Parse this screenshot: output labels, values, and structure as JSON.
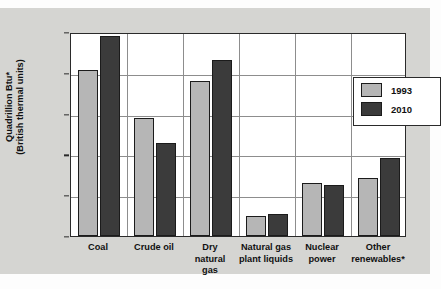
{
  "chart_data": {
    "type": "bar",
    "title": "",
    "xlabel": "",
    "ylabel_line1": "Quadrillion Btu*",
    "ylabel_line2": "(British thermal units)",
    "ylim": [
      0,
      25
    ],
    "yticks": [
      "0",
      "5",
      "10",
      "15",
      "20",
      "25"
    ],
    "grid": true,
    "legend_position": "inside-upper-right",
    "categories": [
      "Coal",
      "Crude oil",
      "Dry\nnatural\ngas",
      "Natural gas\nplant liquids",
      "Nuclear\npower",
      "Other\nrenewables*"
    ],
    "series": [
      {
        "name": "1993",
        "color": "#b6b6b6",
        "values": [
          20.3,
          14.5,
          19.0,
          2.4,
          6.5,
          7.1
        ]
      },
      {
        "name": "2010",
        "color": "#3b3b3b",
        "values": [
          24.5,
          11.4,
          21.6,
          2.7,
          6.3,
          9.5
        ]
      }
    ]
  },
  "legend": {
    "entries": [
      {
        "label": "1993",
        "color": "#b6b6b6"
      },
      {
        "label": "2010",
        "color": "#3b3b3b"
      }
    ]
  }
}
